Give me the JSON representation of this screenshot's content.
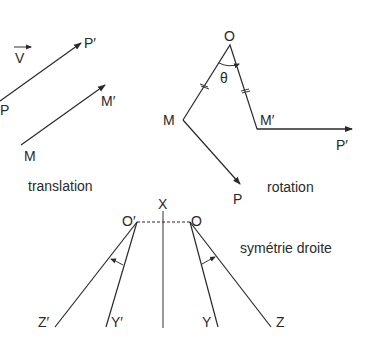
{
  "translation": {
    "caption": "translation",
    "vector_label": "V",
    "points": {
      "P": "P",
      "P_prime": "P′",
      "M": "M",
      "M_prime": "M′"
    }
  },
  "rotation": {
    "caption": "rotation",
    "angle_label": "θ",
    "points": {
      "O": "O",
      "M": "M",
      "M_prime": "M′",
      "P": "P",
      "P_prime": "P′"
    }
  },
  "line_symmetry": {
    "caption": "symétrie droite",
    "axis_label": "X",
    "points": {
      "O_prime": "O′",
      "O": "O",
      "Z_prime": "Z′",
      "Y_prime": "Y′",
      "Y": "Y",
      "Z": "Z"
    }
  },
  "colors": {
    "ink": "#2a2a2a",
    "background": "#ffffff"
  }
}
